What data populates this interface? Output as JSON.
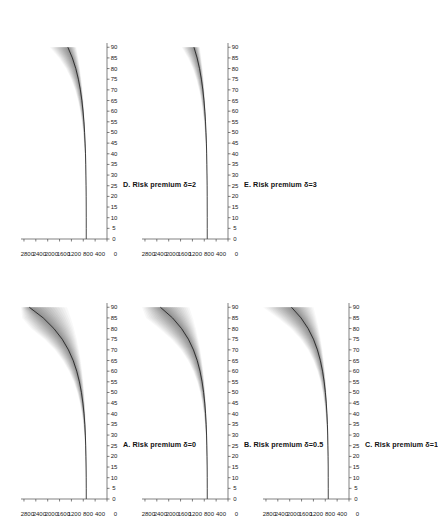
{
  "figure": {
    "rotation_degrees": -90,
    "background_color": "#ffffff",
    "ink_color": "#1a1a1a",
    "band_color": "#555555",
    "median_color": "#101010"
  },
  "chart_data": [
    {
      "type": "line",
      "panel_id": "A",
      "title": "A. Risk premium δ=0",
      "xlabel": "",
      "ylabel": "",
      "xlim": [
        0,
        92
      ],
      "ylim": [
        0,
        2900
      ],
      "xticks": [
        0,
        5,
        10,
        15,
        20,
        25,
        30,
        35,
        40,
        45,
        50,
        55,
        60,
        65,
        70,
        75,
        80,
        85,
        90
      ],
      "yticks": [
        0,
        400,
        800,
        1200,
        1600,
        2000,
        2400,
        2800
      ],
      "grid": false,
      "legend": "none",
      "x": [
        0,
        5,
        10,
        15,
        20,
        25,
        30,
        35,
        40,
        45,
        50,
        55,
        60,
        65,
        70,
        75,
        80,
        85,
        90
      ],
      "series": [
        {
          "name": "median",
          "values": [
            700,
            700,
            702,
            705,
            710,
            718,
            730,
            748,
            775,
            812,
            862,
            930,
            1020,
            1140,
            1300,
            1510,
            1790,
            2150,
            2620
          ]
        },
        {
          "name": "band_upper",
          "values": [
            705,
            706,
            710,
            716,
            726,
            742,
            765,
            798,
            845,
            910,
            1000,
            1120,
            1280,
            1490,
            1760,
            2110,
            2560,
            2860,
            2900
          ]
        },
        {
          "name": "band_lower",
          "values": [
            696,
            695,
            695,
            696,
            698,
            702,
            708,
            717,
            730,
            748,
            772,
            802,
            840,
            888,
            948,
            1022,
            1112,
            1222,
            1350
          ]
        }
      ]
    },
    {
      "type": "line",
      "panel_id": "B",
      "title": "B. Risk premium δ=0.5",
      "xlabel": "",
      "ylabel": "",
      "xlim": [
        0,
        92
      ],
      "ylim": [
        0,
        2900
      ],
      "xticks": [
        0,
        5,
        10,
        15,
        20,
        25,
        30,
        35,
        40,
        45,
        50,
        55,
        60,
        65,
        70,
        75,
        80,
        85,
        90
      ],
      "yticks": [
        0,
        400,
        800,
        1200,
        1600,
        2000,
        2400,
        2800
      ],
      "grid": false,
      "legend": "none",
      "x": [
        0,
        5,
        10,
        15,
        20,
        25,
        30,
        35,
        40,
        45,
        50,
        55,
        60,
        65,
        70,
        75,
        80,
        85,
        90
      ],
      "series": [
        {
          "name": "median",
          "values": [
            700,
            700,
            701,
            703,
            707,
            713,
            722,
            736,
            756,
            784,
            822,
            874,
            944,
            1038,
            1165,
            1335,
            1565,
            1870,
            2280
          ]
        },
        {
          "name": "band_upper",
          "values": [
            704,
            705,
            708,
            713,
            721,
            733,
            751,
            777,
            814,
            866,
            938,
            1036,
            1170,
            1348,
            1588,
            1905,
            2320,
            2760,
            2900
          ]
        },
        {
          "name": "band_lower",
          "values": [
            697,
            696,
            696,
            697,
            699,
            703,
            709,
            718,
            731,
            748,
            771,
            800,
            836,
            881,
            937,
            1005,
            1088,
            1188,
            1305
          ]
        }
      ]
    },
    {
      "type": "line",
      "panel_id": "C",
      "title": "C. Risk premium δ=1",
      "xlabel": "",
      "ylabel": "",
      "xlim": [
        0,
        92
      ],
      "ylim": [
        0,
        2900
      ],
      "xticks": [
        0,
        5,
        10,
        15,
        20,
        25,
        30,
        35,
        40,
        45,
        50,
        55,
        60,
        65,
        70,
        75,
        80,
        85,
        90
      ],
      "yticks": [
        0,
        400,
        800,
        1200,
        1600,
        2000,
        2400,
        2800
      ],
      "grid": false,
      "legend": "none",
      "x": [
        0,
        5,
        10,
        15,
        20,
        25,
        30,
        35,
        40,
        45,
        50,
        55,
        60,
        65,
        70,
        75,
        80,
        85,
        90
      ],
      "series": [
        {
          "name": "median",
          "values": [
            700,
            700,
            701,
            702,
            705,
            710,
            717,
            728,
            744,
            766,
            796,
            837,
            892,
            966,
            1065,
            1198,
            1378,
            1618,
            1940
          ]
        },
        {
          "name": "band_upper",
          "values": [
            703,
            704,
            706,
            710,
            717,
            727,
            741,
            761,
            790,
            830,
            885,
            960,
            1062,
            1198,
            1382,
            1628,
            1960,
            2400,
            2900
          ]
        },
        {
          "name": "band_lower",
          "values": [
            698,
            697,
            697,
            698,
            700,
            703,
            708,
            716,
            727,
            742,
            761,
            786,
            817,
            855,
            901,
            957,
            1024,
            1104,
            1198
          ]
        }
      ]
    },
    {
      "type": "line",
      "panel_id": "D",
      "title": "D. Risk premium δ=2",
      "xlabel": "",
      "ylabel": "",
      "xlim": [
        0,
        92
      ],
      "ylim": [
        0,
        2900
      ],
      "xticks": [
        0,
        5,
        10,
        15,
        20,
        25,
        30,
        35,
        40,
        45,
        50,
        55,
        60,
        65,
        70,
        75,
        80,
        85,
        90
      ],
      "yticks": [
        0,
        400,
        800,
        1200,
        1600,
        2000,
        2400,
        2800
      ],
      "grid": false,
      "legend": "none",
      "x": [
        0,
        5,
        10,
        15,
        20,
        25,
        30,
        35,
        40,
        45,
        50,
        55,
        60,
        65,
        70,
        75,
        80,
        85,
        90
      ],
      "series": [
        {
          "name": "median",
          "values": [
            700,
            700,
            700,
            701,
            703,
            706,
            710,
            716,
            725,
            738,
            755,
            778,
            808,
            847,
            898,
            965,
            1052,
            1168,
            1320
          ]
        },
        {
          "name": "band_upper",
          "values": [
            702,
            702,
            703,
            705,
            709,
            714,
            722,
            734,
            751,
            774,
            805,
            847,
            903,
            977,
            1075,
            1205,
            1380,
            1615,
            1930
          ]
        },
        {
          "name": "band_lower",
          "values": [
            699,
            698,
            698,
            699,
            700,
            702,
            705,
            710,
            717,
            726,
            738,
            754,
            774,
            799,
            830,
            868,
            914,
            969,
            1035
          ]
        }
      ]
    },
    {
      "type": "line",
      "panel_id": "E",
      "title": "E. Risk premium δ=3",
      "xlabel": "",
      "ylabel": "",
      "xlim": [
        0,
        92
      ],
      "ylim": [
        0,
        2900
      ],
      "xticks": [
        0,
        5,
        10,
        15,
        20,
        25,
        30,
        35,
        40,
        45,
        50,
        55,
        60,
        65,
        70,
        75,
        80,
        85,
        90
      ],
      "yticks": [
        0,
        400,
        800,
        1200,
        1600,
        2000,
        2400,
        2800
      ],
      "grid": false,
      "legend": "none",
      "x": [
        0,
        5,
        10,
        15,
        20,
        25,
        30,
        35,
        40,
        45,
        50,
        55,
        60,
        65,
        70,
        75,
        80,
        85,
        90
      ],
      "series": [
        {
          "name": "median",
          "values": [
            700,
            700,
            700,
            701,
            702,
            704,
            707,
            712,
            719,
            728,
            741,
            758,
            781,
            810,
            848,
            897,
            960,
            1042,
            1148
          ]
        },
        {
          "name": "band_upper",
          "values": [
            701,
            701,
            702,
            704,
            707,
            711,
            717,
            726,
            739,
            756,
            779,
            810,
            851,
            904,
            974,
            1065,
            1185,
            1345,
            1560
          ]
        },
        {
          "name": "band_lower",
          "values": [
            699,
            699,
            699,
            699,
            700,
            702,
            704,
            708,
            713,
            720,
            730,
            742,
            757,
            776,
            799,
            827,
            861,
            902,
            950
          ]
        }
      ]
    }
  ],
  "panels": [
    {
      "id": "A",
      "title": "A. Risk premium δ=0",
      "xticks": [
        "0",
        "5",
        "10",
        "15",
        "20",
        "25",
        "30",
        "35",
        "40",
        "45",
        "50",
        "55",
        "60",
        "65",
        "70",
        "75",
        "80",
        "85",
        "90"
      ],
      "yticks": [
        "0",
        "400",
        "800",
        "1200",
        "1600",
        "2000",
        "2400",
        "2800"
      ]
    },
    {
      "id": "B",
      "title": "B. Risk premium δ=0.5",
      "xticks": [
        "0",
        "5",
        "10",
        "15",
        "20",
        "25",
        "30",
        "35",
        "40",
        "45",
        "50",
        "55",
        "60",
        "65",
        "70",
        "75",
        "80",
        "85",
        "90"
      ],
      "yticks": [
        "0",
        "400",
        "800",
        "1200",
        "1600",
        "2000",
        "2400",
        "2800"
      ]
    },
    {
      "id": "C",
      "title": "C. Risk premium δ=1",
      "xticks": [
        "0",
        "5",
        "10",
        "15",
        "20",
        "25",
        "30",
        "35",
        "40",
        "45",
        "50",
        "55",
        "60",
        "65",
        "70",
        "75",
        "80",
        "85",
        "90"
      ],
      "yticks": [
        "0",
        "400",
        "800",
        "1200",
        "1600",
        "2000",
        "2400",
        "2800"
      ]
    },
    {
      "id": "D",
      "title": "D. Risk premium δ=2",
      "xticks": [
        "0",
        "5",
        "10",
        "15",
        "20",
        "25",
        "30",
        "35",
        "40",
        "45",
        "50",
        "55",
        "60",
        "65",
        "70",
        "75",
        "80",
        "85",
        "90"
      ],
      "yticks": [
        "0",
        "400",
        "800",
        "1200",
        "1600",
        "2000",
        "2400",
        "2800"
      ]
    },
    {
      "id": "E",
      "title": "E. Risk premium δ=3",
      "xticks": [
        "0",
        "5",
        "10",
        "15",
        "20",
        "25",
        "30",
        "35",
        "40",
        "45",
        "50",
        "55",
        "60",
        "65",
        "70",
        "75",
        "80",
        "85",
        "90"
      ],
      "yticks": [
        "0",
        "400",
        "800",
        "1200",
        "1600",
        "2000",
        "2400",
        "2800"
      ]
    }
  ]
}
